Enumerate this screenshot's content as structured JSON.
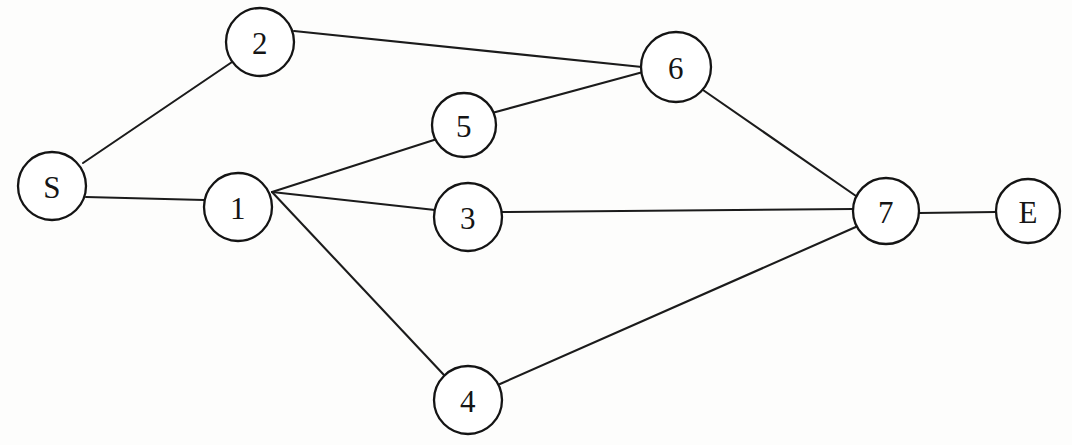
{
  "diagram": {
    "type": "node-link-graph",
    "background_color": "#fdfdfc",
    "stroke_color": "#1b1b1b",
    "node_fill_color": "#ffffff",
    "node_stroke_color": "#141414",
    "label_color": "#151515",
    "canvas": {
      "width": 1072,
      "height": 445
    },
    "nodes": [
      {
        "id": "S",
        "label": "S",
        "cx": 52,
        "cy": 186,
        "r": 34
      },
      {
        "id": "2",
        "label": "2",
        "cx": 260,
        "cy": 42,
        "r": 34
      },
      {
        "id": "1",
        "label": "1",
        "cx": 238,
        "cy": 207,
        "r": 34
      },
      {
        "id": "5",
        "label": "5",
        "cx": 464,
        "cy": 125,
        "r": 32
      },
      {
        "id": "3",
        "label": "3",
        "cx": 468,
        "cy": 217,
        "r": 34
      },
      {
        "id": "4",
        "label": "4",
        "cx": 468,
        "cy": 400,
        "r": 34
      },
      {
        "id": "6",
        "label": "6",
        "cx": 676,
        "cy": 67,
        "r": 35
      },
      {
        "id": "7",
        "label": "7",
        "cx": 886,
        "cy": 211,
        "r": 33
      },
      {
        "id": "E",
        "label": "E",
        "cx": 1028,
        "cy": 211,
        "r": 32
      }
    ],
    "edges": [
      {
        "id": "edge-s-2",
        "from": "S",
        "to": "2",
        "x1": 83,
        "y1": 163,
        "x2": 235,
        "y2": 60
      },
      {
        "id": "edge-s-1",
        "from": "S",
        "to": "1",
        "x1": 86,
        "y1": 197,
        "x2": 204,
        "y2": 200
      },
      {
        "id": "edge-2-6",
        "from": "2",
        "to": "6",
        "x1": 294,
        "y1": 31,
        "x2": 642,
        "y2": 67
      },
      {
        "id": "edge-1-5",
        "from": "1",
        "to": "5",
        "x1": 272,
        "y1": 192,
        "x2": 437,
        "y2": 139
      },
      {
        "id": "edge-5-6",
        "from": "5",
        "to": "6",
        "x1": 492,
        "y1": 113,
        "x2": 643,
        "y2": 72
      },
      {
        "id": "edge-1-3",
        "from": "1",
        "to": "3",
        "x1": 272,
        "y1": 192,
        "x2": 435,
        "y2": 210
      },
      {
        "id": "edge-1-4",
        "from": "1",
        "to": "4",
        "x1": 272,
        "y1": 192,
        "x2": 444,
        "y2": 375
      },
      {
        "id": "edge-6-7",
        "from": "6",
        "to": "7",
        "x1": 703,
        "y1": 90,
        "x2": 856,
        "y2": 196
      },
      {
        "id": "edge-3-7",
        "from": "3",
        "to": "7",
        "x1": 502,
        "y1": 212,
        "x2": 853,
        "y2": 209
      },
      {
        "id": "edge-4-7",
        "from": "4",
        "to": "7",
        "x1": 500,
        "y1": 384,
        "x2": 858,
        "y2": 226
      },
      {
        "id": "edge-7-e",
        "from": "7",
        "to": "E",
        "x1": 919,
        "y1": 213,
        "x2": 996,
        "y2": 212
      }
    ]
  }
}
